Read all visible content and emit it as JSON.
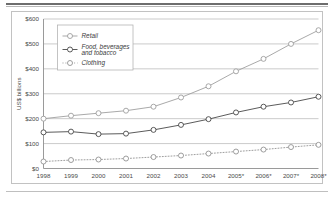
{
  "chart_data": {
    "type": "line",
    "title": "",
    "subtitle": "",
    "xlabel": "",
    "ylabel": "US$ billions",
    "ylim": [
      0,
      600
    ],
    "ytick_step": 100,
    "ytick_labels": [
      "$0",
      "$100",
      "$200",
      "$300",
      "$400",
      "$500",
      "$600"
    ],
    "ytick_values": [
      0,
      100,
      200,
      300,
      400,
      500,
      600
    ],
    "grid": true,
    "grid_axis": "y",
    "legend_position": "upper-left-inside",
    "categories": [
      "1998",
      "1999",
      "2000",
      "2001",
      "2002",
      "2003",
      "2004",
      "2005*",
      "2006*",
      "2007*",
      "2008*"
    ],
    "x": [
      1998,
      1999,
      2000,
      2001,
      2002,
      2003,
      2004,
      2005,
      2006,
      2007,
      2008
    ],
    "footnote": "* denotes projected values",
    "series": [
      {
        "name": "Retail",
        "values": [
          200,
          212,
          222,
          232,
          248,
          285,
          330,
          390,
          440,
          500,
          555
        ],
        "color": "#9a9a9a",
        "line_style": "solid",
        "marker": "open-circle"
      },
      {
        "name": "Food, beverages and tobacco",
        "values": [
          145,
          148,
          138,
          140,
          155,
          175,
          198,
          225,
          248,
          265,
          288
        ],
        "color": "#3d3d3d",
        "line_style": "solid",
        "marker": "open-circle"
      },
      {
        "name": "Clothing",
        "values": [
          28,
          34,
          36,
          40,
          46,
          52,
          60,
          68,
          76,
          86,
          95
        ],
        "color": "#8c8c8c",
        "line_style": "dotted",
        "marker": "open-circle"
      }
    ]
  },
  "legend": {
    "entries": [
      {
        "label": "Retail"
      },
      {
        "label": "Food, beverages and tobacco"
      },
      {
        "label": "Clothing"
      }
    ]
  }
}
